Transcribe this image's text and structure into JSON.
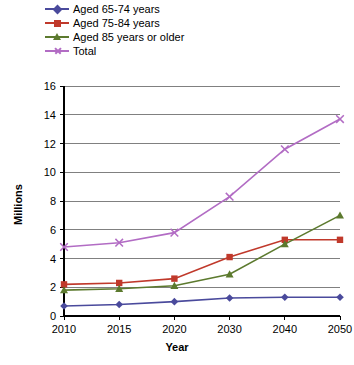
{
  "chart_data": {
    "type": "line",
    "title": "",
    "subtitle": "",
    "xlabel": "Year",
    "ylabel": "Millions",
    "categories": [
      "2010",
      "2015",
      "2020",
      "2030",
      "2040",
      "2050"
    ],
    "x": [
      2010,
      2015,
      2020,
      2030,
      2040,
      2050
    ],
    "ylim": [
      0,
      16
    ],
    "ytick_step": 2,
    "yticks": [
      "0",
      "2",
      "4",
      "6",
      "8",
      "10",
      "12",
      "14",
      "16"
    ],
    "grid": "horizontal",
    "legend_position": "top-left",
    "series": [
      {
        "name": "Aged 65-74 years",
        "color": "#4a4a9c",
        "marker": "diamond",
        "values": [
          0.7,
          0.8,
          1.0,
          1.25,
          1.3,
          1.3
        ]
      },
      {
        "name": "Aged 75-84 years",
        "color": "#c0392b",
        "marker": "square",
        "values": [
          2.2,
          2.3,
          2.6,
          4.1,
          5.3,
          5.3
        ]
      },
      {
        "name": "Aged 85 years or older",
        "color": "#5c7a2e",
        "marker": "triangle",
        "values": [
          1.8,
          1.9,
          2.1,
          2.9,
          5.0,
          7.0
        ]
      },
      {
        "name": "Total",
        "color": "#b26cc4",
        "marker": "cross",
        "values": [
          4.8,
          5.1,
          5.8,
          8.3,
          11.6,
          13.7
        ]
      }
    ]
  },
  "colors": {
    "axis": "#000000",
    "grid": "#808080",
    "background": "#ffffff"
  }
}
